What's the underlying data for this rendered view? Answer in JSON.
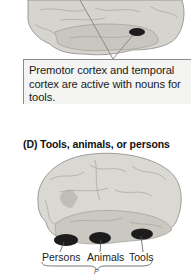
{
  "figure": {
    "panel_c": {
      "callout_text": "Premotor cortex and temporal cortex are active with nouns for tools."
    },
    "panel_d": {
      "title": "(D)  Tools, animals, or persons",
      "labels": [
        "Persons",
        "Animals",
        "Tools"
      ],
      "brace_note": "P"
    },
    "colors": {
      "brain_fill": "#d9d7d2",
      "brain_shade": "#b9b6b0",
      "activation": "#1c1c1c",
      "callout_bg": "#f4f4f2",
      "callout_border": "#8a8a8a"
    }
  }
}
